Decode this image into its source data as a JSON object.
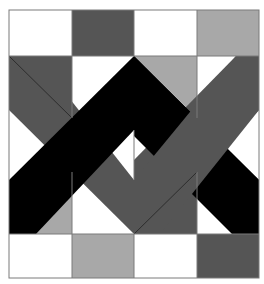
{
  "colors": {
    "white": "#ffffff",
    "light_gray": "#a8a8a8",
    "dark_gray": "#555555",
    "black": "#000000",
    "outline": "#7a7a7a"
  },
  "grid": {
    "columns": 4,
    "rows_top": 1,
    "rows_bottom": 1,
    "top_row": [
      "white",
      "dark_gray",
      "white",
      "light_gray"
    ],
    "bottom_row": [
      "white",
      "light_gray",
      "white",
      "dark_gray"
    ]
  },
  "bands": [
    {
      "name": "black-band",
      "color": "black",
      "shape": "inverted-V from bottom-left up to top-center then down to right"
    },
    {
      "name": "dark-gray-band",
      "color": "dark_gray",
      "shape": "V from top-left down to bottom-center then up to top-right"
    }
  ]
}
